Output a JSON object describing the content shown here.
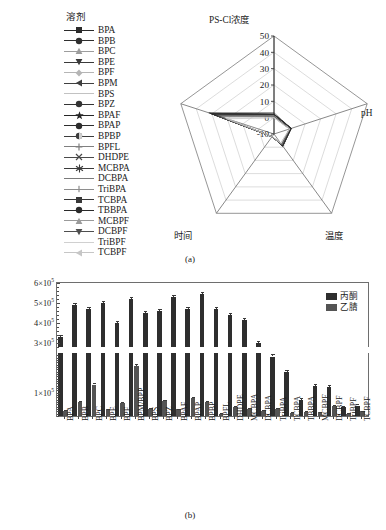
{
  "figure": {
    "panel_a_caption": "(a)",
    "panel_b_caption": "(b)"
  },
  "radar": {
    "legend_title": "溶剂",
    "axes": [
      {
        "name": "PS-Cl浓度",
        "position": "top"
      },
      {
        "name": "pH",
        "position": "right"
      },
      {
        "name": "温度",
        "position": "bottom-right"
      },
      {
        "name": "时间",
        "position": "bottom-left"
      },
      {
        "name": "",
        "position": "left"
      }
    ],
    "tick_labels": [
      "50",
      "40",
      "30",
      "20",
      "10",
      "0",
      "-10"
    ],
    "scale_min": -10,
    "scale_max": 50,
    "series": [
      {
        "label": "BPA",
        "marker": "square",
        "color": "#2b2b2b",
        "values": [
          2,
          1,
          -1,
          -8,
          30
        ]
      },
      {
        "label": "BPB",
        "marker": "circle",
        "color": "#2f2f2f",
        "values": [
          2,
          1,
          -1,
          -8,
          31
        ]
      },
      {
        "label": "BPC",
        "marker": "triangle-up",
        "color": "#9d9d9d",
        "values": [
          1,
          1,
          -2,
          -8,
          28
        ]
      },
      {
        "label": "BPE",
        "marker": "triangle-down",
        "color": "#3a3a3a",
        "values": [
          2,
          1,
          -1,
          -8,
          29
        ]
      },
      {
        "label": "BPF",
        "marker": "diamond",
        "color": "#b5b5b5",
        "values": [
          1,
          0,
          -2,
          -8,
          26
        ]
      },
      {
        "label": "BPM",
        "marker": "triangle-left",
        "color": "#3f3f3f",
        "values": [
          2,
          1,
          -1,
          -8,
          30
        ]
      },
      {
        "label": "BPS",
        "marker": "line",
        "color": "#c2c2c2",
        "values": [
          0,
          0,
          -3,
          -8,
          22
        ]
      },
      {
        "label": "BPZ",
        "marker": "circle",
        "color": "#333333",
        "values": [
          2,
          1,
          -1,
          -8,
          30
        ]
      },
      {
        "label": "BPAF",
        "marker": "star",
        "color": "#262626",
        "values": [
          3,
          1,
          -1,
          -8,
          32
        ]
      },
      {
        "label": "BPAP",
        "marker": "circle",
        "color": "#2d2d2d",
        "values": [
          2,
          1,
          -1,
          -8,
          31
        ]
      },
      {
        "label": "BPBP",
        "marker": "circle-half",
        "color": "#3c3c3c",
        "values": [
          2,
          1,
          -1,
          -8,
          30
        ]
      },
      {
        "label": "BPFL",
        "marker": "plus",
        "color": "#808080",
        "values": [
          1,
          0,
          -2,
          -8,
          27
        ]
      },
      {
        "label": "DHDPE",
        "marker": "cross",
        "color": "#4a4a4a",
        "values": [
          1,
          0,
          -2,
          -8,
          25
        ]
      },
      {
        "label": "MCBPA",
        "marker": "asterisk",
        "color": "#3a3a3a",
        "values": [
          2,
          1,
          -1,
          -8,
          29
        ]
      },
      {
        "label": "DCBPA",
        "marker": "line",
        "color": "#7a7a7a",
        "values": [
          1,
          0,
          -2,
          -8,
          27
        ]
      },
      {
        "label": "TriBPA",
        "marker": "dash-bar",
        "color": "#8e8e8e",
        "values": [
          1,
          0,
          -2,
          -8,
          26
        ]
      },
      {
        "label": "TCBPA",
        "marker": "square",
        "color": "#383838",
        "values": [
          2,
          1,
          -1,
          -8,
          28
        ]
      },
      {
        "label": "TBBPA",
        "marker": "circle",
        "color": "#2a2a2a",
        "values": [
          2,
          1,
          -1,
          -8,
          30
        ]
      },
      {
        "label": "MCBPF",
        "marker": "triangle-up",
        "color": "#9a9a9a",
        "values": [
          1,
          0,
          -2,
          -8,
          24
        ]
      },
      {
        "label": "DCBPF",
        "marker": "triangle-down",
        "color": "#4f4f4f",
        "values": [
          1,
          0,
          -2,
          -8,
          26
        ]
      },
      {
        "label": "TriBPF",
        "marker": "line",
        "color": "#d0d0d0",
        "values": [
          0,
          0,
          -3,
          -8,
          21
        ]
      },
      {
        "label": "TCBPF",
        "marker": "triangle-left",
        "color": "#c6c6c6",
        "values": [
          0,
          0,
          -3,
          -8,
          20
        ]
      }
    ]
  },
  "chart_data": {
    "type": "bar",
    "title": "",
    "xlabel": "",
    "ylabel": "",
    "ylim": [
      0,
      600000
    ],
    "axis_break": {
      "lower_max": 270000,
      "upper_min": 280000
    },
    "grid": false,
    "legend_position": "top-right",
    "ytick_labels": [
      "6×10⁵",
      "5×10⁵",
      "4×10⁵",
      "3×10⁵",
      "1×10⁵"
    ],
    "ytick_values": [
      600000,
      500000,
      400000,
      300000,
      100000
    ],
    "categories": [
      "BPA",
      "BPB",
      "BPC",
      "BPE",
      "BPF",
      "BPM/BPP",
      "BPS",
      "BPZ",
      "BPAF",
      "BPAP",
      "BPBP",
      "BPFL",
      "DHDPE",
      "MCBPA",
      "DCBPA",
      "TriBPA",
      "TCBPA",
      "TBBPA",
      "MCBPF",
      "DCBPF",
      "TriBPF",
      "TCBPF"
    ],
    "series": [
      {
        "name": "丙酮",
        "color": "#2e2e2e",
        "values": [
          330000,
          490000,
          470000,
          500000,
          400000,
          520000,
          450000,
          460000,
          530000,
          470000,
          545000,
          470000,
          440000,
          415000,
          300000,
          255000,
          190000,
          70000,
          130000,
          125000,
          40000,
          45000
        ],
        "errors": [
          12000,
          10000,
          10000,
          10000,
          9000,
          10000,
          9000,
          9000,
          10000,
          9000,
          11000,
          9000,
          9000,
          9000,
          9000,
          9000,
          8000,
          6000,
          7000,
          7000,
          5000,
          5000
        ]
      },
      {
        "name": "乙腈",
        "color": "#545454",
        "values": [
          22000,
          60000,
          135000,
          28000,
          55000,
          215000,
          30000,
          65000,
          28000,
          78000,
          60000,
          10000,
          40000,
          30000,
          22000,
          30000,
          15000,
          18000,
          16000,
          45000,
          10000,
          20000
        ],
        "errors": [
          4000,
          5000,
          6000,
          4000,
          5000,
          7000,
          4000,
          5000,
          4000,
          5000,
          5000,
          3000,
          4000,
          4000,
          4000,
          4000,
          3000,
          3000,
          3000,
          4000,
          3000,
          3000
        ]
      }
    ]
  }
}
